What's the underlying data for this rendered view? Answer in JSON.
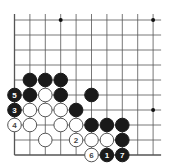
{
  "diagram": {
    "type": "go-board-partial",
    "grid": {
      "cols": 10,
      "rows": 10,
      "x0": 14.5,
      "y0": 20,
      "dx": 15.4,
      "dy": 15.0,
      "right_extend": 8,
      "line_color": "#555555",
      "edge_left": true,
      "edge_bottom": true
    },
    "star_points": [
      {
        "col": 3,
        "row": 0
      },
      {
        "col": 9,
        "row": 0
      },
      {
        "col": 9,
        "row": 6
      }
    ],
    "stones": [
      {
        "col": 1,
        "row": 4,
        "color": "black"
      },
      {
        "col": 2,
        "row": 4,
        "color": "black"
      },
      {
        "col": 3,
        "row": 4,
        "color": "black"
      },
      {
        "col": 0,
        "row": 5,
        "color": "black",
        "label": "5"
      },
      {
        "col": 1,
        "row": 5,
        "color": "black"
      },
      {
        "col": 2,
        "row": 5,
        "color": "white"
      },
      {
        "col": 3,
        "row": 5,
        "color": "black"
      },
      {
        "col": 5,
        "row": 5,
        "color": "black"
      },
      {
        "col": 0,
        "row": 6,
        "color": "black",
        "label": "3"
      },
      {
        "col": 1,
        "row": 6,
        "color": "white"
      },
      {
        "col": 2,
        "row": 6,
        "color": "white"
      },
      {
        "col": 3,
        "row": 6,
        "color": "white"
      },
      {
        "col": 4,
        "row": 6,
        "color": "black"
      },
      {
        "col": 0,
        "row": 7,
        "color": "white",
        "label": "4"
      },
      {
        "col": 1,
        "row": 7,
        "color": "white"
      },
      {
        "col": 3,
        "row": 7,
        "color": "white"
      },
      {
        "col": 4,
        "row": 7,
        "color": "white"
      },
      {
        "col": 5,
        "row": 7,
        "color": "black"
      },
      {
        "col": 6,
        "row": 7,
        "color": "black"
      },
      {
        "col": 7,
        "row": 7,
        "color": "black"
      },
      {
        "col": 2,
        "row": 8,
        "color": "white"
      },
      {
        "col": 4,
        "row": 8,
        "color": "white",
        "label": "2"
      },
      {
        "col": 5,
        "row": 8,
        "color": "white"
      },
      {
        "col": 6,
        "row": 8,
        "color": "white"
      },
      {
        "col": 7,
        "row": 8,
        "color": "black"
      },
      {
        "col": 5,
        "row": 9,
        "color": "white",
        "label": "6"
      },
      {
        "col": 6,
        "row": 9,
        "color": "black",
        "label": "1"
      },
      {
        "col": 7,
        "row": 9,
        "color": "black",
        "label": "7"
      }
    ],
    "colors": {
      "black_stone": "#1a1a1a",
      "white_stone": "#ffffff",
      "white_stroke": "#555555",
      "black_label": "#ffffff",
      "white_label": "#444444",
      "star": "#111111"
    }
  }
}
